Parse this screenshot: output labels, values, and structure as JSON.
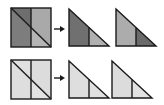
{
  "diagram": {
    "rows": [
      {
        "name": "top-row",
        "shading": "dark",
        "colors": {
          "square_top_left": "#6e6e6e",
          "square_top_right": "#a9a9a9",
          "square_bottom_left": "#7d7d7d",
          "square_bottom_right": "#b4b4b4",
          "triangle1_left": "#707070",
          "triangle1_right": "#b0b0b0",
          "triangle2_left": "#acacac",
          "triangle2_right": "#6a6a6a"
        }
      },
      {
        "name": "bottom-row",
        "shading": "light",
        "colors": {
          "square_top_left": "#e0e0e0",
          "square_top_right": "#dcdcdc",
          "square_bottom_left": "#dedede",
          "square_bottom_right": "#e2e2e2",
          "triangle1_left": "#dedede",
          "triangle1_right": "#e0e0e0",
          "triangle2_left": "#dcdcdc",
          "triangle2_right": "#e2e2e2"
        }
      }
    ],
    "arrow": {
      "glyph": "right-arrow",
      "color": "#1a1a1a"
    },
    "outline_color": "#1a1a1a"
  }
}
